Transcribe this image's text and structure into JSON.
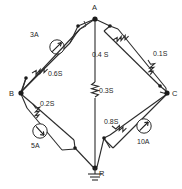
{
  "diagram": {
    "units_note": "S",
    "colors": {
      "ink": "#2b2b2b",
      "node": "#1b1b1b",
      "background": "#ffffff"
    },
    "nodes": [
      {
        "id": "A",
        "label": "A",
        "x": 95,
        "y": 17
      },
      {
        "id": "B",
        "label": "B",
        "x": 20,
        "y": 93
      },
      {
        "id": "C",
        "label": "C",
        "x": 168,
        "y": 93
      },
      {
        "id": "R",
        "label": "R",
        "x": 95,
        "y": 169,
        "ground": true
      }
    ],
    "elements": [
      {
        "id": "src-3a",
        "kind": "current-source",
        "label": "3A",
        "between": [
          "A",
          "B"
        ],
        "branch": "outer"
      },
      {
        "id": "r-06s",
        "kind": "resistor",
        "label": "0.6S",
        "between": [
          "A",
          "B"
        ],
        "branch": "inner"
      },
      {
        "id": "r-04s",
        "kind": "resistor",
        "label": "0.4 S",
        "between": [
          "A",
          "C"
        ],
        "branch": "inner"
      },
      {
        "id": "r-01s",
        "kind": "resistor",
        "label": "0.1S",
        "between": [
          "A",
          "C"
        ],
        "branch": "outer"
      },
      {
        "id": "r-03s",
        "kind": "resistor",
        "label": "0.3S",
        "between": [
          "A",
          "R"
        ],
        "branch": "center"
      },
      {
        "id": "r-02s",
        "kind": "resistor",
        "label": "0.2S",
        "between": [
          "B",
          "R"
        ],
        "branch": "inner"
      },
      {
        "id": "src-5a",
        "kind": "current-source",
        "label": "5A",
        "between": [
          "B",
          "R"
        ],
        "branch": "outer"
      },
      {
        "id": "r-08s",
        "kind": "resistor",
        "label": "0.8S",
        "between": [
          "C",
          "R"
        ],
        "branch": "inner"
      },
      {
        "id": "src-10a",
        "kind": "current-source",
        "label": "10A",
        "between": [
          "C",
          "R"
        ],
        "branch": "outer"
      }
    ],
    "icons": {
      "ground": "ground-icon",
      "source": "current-source-icon",
      "resistor": "resistor-icon"
    }
  }
}
